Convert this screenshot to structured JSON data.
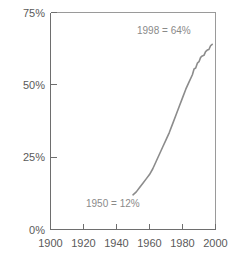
{
  "chart_data": {
    "type": "line",
    "title": "",
    "subtitle": "",
    "xlabel": "",
    "ylabel": "",
    "xlim": [
      1900,
      2000
    ],
    "ylim": [
      0,
      75
    ],
    "grid": false,
    "legend": "none",
    "x_ticks": [
      1900,
      1920,
      1940,
      1960,
      1980,
      2000
    ],
    "x_tick_labels": [
      "1900",
      "1920",
      "1940",
      "1960",
      "1980",
      "2000"
    ],
    "y_ticks": [
      0,
      25,
      50,
      75
    ],
    "y_tick_labels": [
      "0%",
      "25%",
      "50%",
      "75%"
    ],
    "series": [
      {
        "name": "percent",
        "x": [
          1950,
          1952,
          1954,
          1956,
          1958,
          1960,
          1962,
          1964,
          1966,
          1968,
          1970,
          1972,
          1974,
          1976,
          1978,
          1980,
          1982,
          1984,
          1986,
          1987,
          1988,
          1989,
          1990,
          1991,
          1992,
          1993,
          1994,
          1995,
          1996,
          1997,
          1998
        ],
        "values": [
          12,
          13,
          14.5,
          16,
          17.5,
          19,
          21,
          23.5,
          26,
          28.5,
          31,
          33.5,
          36.5,
          39.5,
          42.5,
          45.5,
          48.5,
          51,
          53.5,
          55.5,
          55.8,
          57.5,
          58,
          59.5,
          60,
          60.2,
          61.5,
          62,
          62.2,
          63.5,
          64
        ]
      }
    ],
    "annotations": [
      {
        "name": "end-point-label",
        "text": "1998 = 64%",
        "x": 1998,
        "y": 64
      },
      {
        "name": "start-point-label",
        "text": "1950 = 12%",
        "x": 1950,
        "y": 12
      }
    ],
    "colors": {
      "curve": "#8c8c8c",
      "axis": "#6e6e6e",
      "frame": "#9a9a9a",
      "tick_text": "#5a5a5a",
      "annotation_text": "#8a8a8a",
      "background": "#ffffff"
    }
  }
}
